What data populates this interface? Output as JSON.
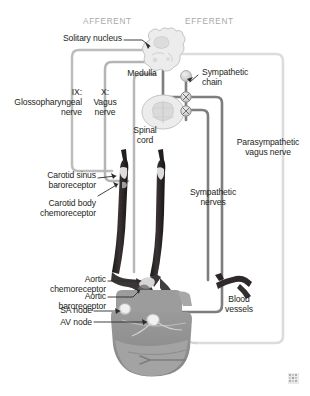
{
  "figure": {
    "title_partial": "",
    "headers": {
      "afferent": "AFFERENT",
      "efferent": "EFFERENT"
    },
    "watermark": "watermark-mark"
  },
  "labels": {
    "solitary_nucleus": "Solitary nucleus",
    "medulla": "Medulla",
    "sympathetic_chain_l1": "Sympathetic",
    "sympathetic_chain_l2": "chain",
    "nerve_ix_l1": "IX:",
    "nerve_ix_l2": "Glossopharyngeal",
    "nerve_ix_l3": "nerve",
    "nerve_x_l1": "X:",
    "nerve_x_l2": "Vagus",
    "nerve_x_l3": "nerve",
    "spinal_cord_l1": "Spinal",
    "spinal_cord_l2": "cord",
    "parasympathetic_l1": "Parasympathetic",
    "parasympathetic_l2": "vagus nerve",
    "carotid_sinus_l1": "Carotid sinus",
    "carotid_sinus_l2": "baroreceptor",
    "carotid_body_l1": "Carotid body",
    "carotid_body_l2": "chemoreceptor",
    "sympathetic_nerves_l1": "Sympathetic",
    "sympathetic_nerves_l2": "nerves",
    "aortic_chemo_l1": "Aortic",
    "aortic_chemo_l2": "chemoreceptor",
    "aortic_baro_l1": "Aortic",
    "aortic_baro_l2": "baroreceptor",
    "sa_node": "SA node",
    "av_node": "AV node",
    "blood_vessels_l1": "Blood",
    "blood_vessels_l2": "vessels"
  },
  "colors": {
    "text": "#231f20",
    "header_gray": "#a8a8a8",
    "leader_line": "#3a3a3a",
    "afferent_path": "#b9b9b9",
    "efferent_sympathetic": "#7d7d7d",
    "efferent_parasympathetic": "#d8d8d8",
    "artery_dark": "#241f1f",
    "heart_body": "#8e8e8e",
    "heart_light": "#b0b0b0",
    "aorta_dark": "#3c3a3a",
    "brain_fill": "#ebebeb",
    "brain_stroke": "#bdbdbd",
    "node_light": "#e6e6e6",
    "background": "#ffffff"
  },
  "anatomy": {
    "structures": [
      "medulla-oblongata",
      "spinal-cord-cross-section",
      "sympathetic-chain-ganglia",
      "carotid-artery-left",
      "carotid-artery-right",
      "aortic-arch",
      "heart",
      "sa-node",
      "av-node",
      "blood-vessel-branch"
    ],
    "pathway_types": {
      "afferent": "sensory input to solitary nucleus",
      "efferent_sympathetic": "sympathetic outflow via sympathetic chain",
      "efferent_parasympathetic": "parasympathetic vagal outflow"
    }
  }
}
